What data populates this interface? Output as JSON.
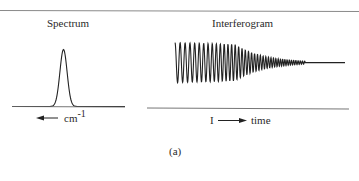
{
  "figure": {
    "caption": "(a)",
    "panels": {
      "spectrum": {
        "title": "Spectrum",
        "axis_label": "cm",
        "axis_label_superscript": "-1",
        "axis_arrow_direction": "left",
        "shape": "single narrow peak (Gaussian-like)"
      },
      "interferogram": {
        "title": "Interferogram",
        "axis_label_prefix": "I",
        "axis_label": "time",
        "axis_arrow_direction": "right",
        "shape": "decaying oscillation (increasing frequency, decreasing amplitude) then flat line"
      }
    }
  },
  "colors": {
    "ink": "#222222",
    "rule": "#8a8a8a",
    "background": "#ffffff"
  }
}
